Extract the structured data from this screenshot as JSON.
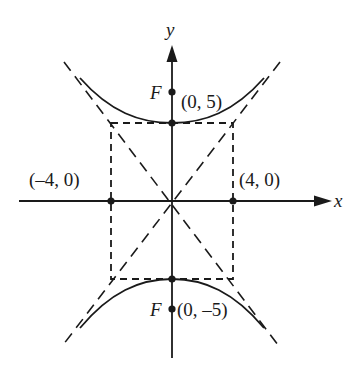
{
  "diagram": {
    "type": "hyperbola",
    "orientation": "vertical-transverse-axis",
    "axes": {
      "x_label": "x",
      "y_label": "y"
    },
    "points": [
      {
        "id": "vertex-top",
        "label": "(0, 5)"
      },
      {
        "id": "vertex-bottom",
        "label": "(0, –5)"
      },
      {
        "id": "co-vertex-left",
        "label": "(–4, 0)"
      },
      {
        "id": "co-vertex-right",
        "label": "(4, 0)"
      }
    ],
    "foci": [
      {
        "id": "focus-top",
        "label": "F"
      },
      {
        "id": "focus-bottom",
        "label": "F"
      }
    ],
    "elements": {
      "fundamental_rectangle": "dashed",
      "asymptotes": "dashed diagonals through rectangle corners",
      "branches": "upper and lower"
    },
    "colors": {
      "ink": "#1a1a1a",
      "background": "#ffffff"
    }
  }
}
